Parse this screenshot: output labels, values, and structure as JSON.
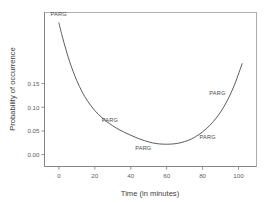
{
  "chart_data": {
    "type": "line",
    "title": "",
    "xlabel": "Time (in minutes)",
    "ylabel": "Probability of occurrence",
    "xlim": [
      -8,
      110
    ],
    "ylim": [
      -0.025,
      0.3
    ],
    "xticks": [
      0,
      20,
      40,
      60,
      80,
      100
    ],
    "xticklabels": [
      "0",
      "20",
      "40",
      "60",
      "80",
      "100"
    ],
    "yticks": [
      0.0,
      0.05,
      0.1,
      0.15
    ],
    "yticklabels": [
      "0.00",
      "0.05",
      "0.10",
      "0.15"
    ],
    "grid": false,
    "legend": false,
    "series": [
      {
        "name": "PARG",
        "x": [
          0,
          2,
          4,
          6,
          8,
          10,
          13,
          16,
          20,
          24,
          28,
          32,
          36,
          40,
          45,
          50,
          54,
          58,
          62,
          66,
          70,
          74,
          78,
          82,
          86,
          90,
          94,
          98,
          102
        ],
        "y": [
          0.278,
          0.248,
          0.221,
          0.196,
          0.175,
          0.156,
          0.132,
          0.113,
          0.093,
          0.078,
          0.066,
          0.056,
          0.048,
          0.041,
          0.033,
          0.027,
          0.0235,
          0.0222,
          0.0222,
          0.0238,
          0.0275,
          0.0335,
          0.0425,
          0.0545,
          0.07,
          0.09,
          0.116,
          0.15,
          0.192
        ]
      }
    ],
    "point_labels": [
      {
        "text": "PARG",
        "x": 1,
        "y": 0.277,
        "dx": -2,
        "dy": -7
      },
      {
        "text": "PARG",
        "x": 24,
        "y": 0.078,
        "dx": 8,
        "dy": 4
      },
      {
        "text": "PARG",
        "x": 47,
        "y": 0.03,
        "dx": 0,
        "dy": 10
      },
      {
        "text": "PARG",
        "x": 80,
        "y": 0.046,
        "dx": 5,
        "dy": 6
      },
      {
        "text": "PARG",
        "x": 96,
        "y": 0.13,
        "dx": -14,
        "dy": 2
      }
    ],
    "colors": {
      "curve": "#4a4a4a",
      "axis": "#7a7a7a",
      "frame": "#9a9a9a",
      "text": "#4a4a4a",
      "background": "#ffffff"
    }
  }
}
